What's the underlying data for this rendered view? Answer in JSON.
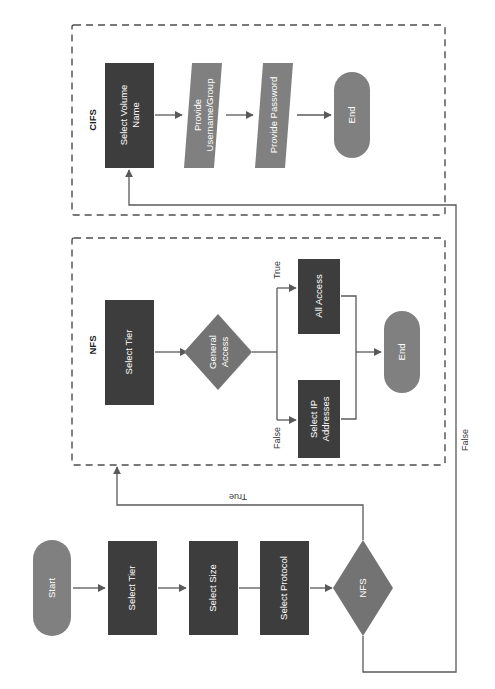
{
  "diagram": {
    "orientation": "rotated-90-counterclockwise",
    "colors": {
      "process_fill": "#3d3d3d",
      "terminal_fill": "#808080",
      "decision_fill": "#737373",
      "io_fill": "#808080",
      "edge_stroke": "#595959",
      "group_border": "#4d4d4d",
      "label_text": "#ffffff",
      "background": "#ffffff"
    },
    "groups": [
      {
        "id": "cifs",
        "label": "CIFS"
      },
      {
        "id": "nfs",
        "label": "NFS"
      }
    ],
    "nodes": [
      {
        "id": "start",
        "label": "Start",
        "shape": "terminal"
      },
      {
        "id": "tier_main",
        "label": "Select Tier",
        "shape": "process"
      },
      {
        "id": "size",
        "label": "Select Size",
        "shape": "process"
      },
      {
        "id": "protocol",
        "label": "Select Protocol",
        "shape": "process"
      },
      {
        "id": "nfs_dec",
        "label": "NFS",
        "shape": "decision"
      },
      {
        "id": "nfs_tier",
        "label": "Select Tier",
        "shape": "process"
      },
      {
        "id": "gen_access",
        "label": "General Access",
        "shape": "decision"
      },
      {
        "id": "all_access",
        "label": "All Access",
        "shape": "process"
      },
      {
        "id": "select_ip",
        "label": "Select IP Addresses",
        "shape": "process"
      },
      {
        "id": "nfs_end",
        "label": "End",
        "shape": "terminal"
      },
      {
        "id": "vol_name",
        "label": "Select Volume Name",
        "shape": "process"
      },
      {
        "id": "username",
        "label": "Provide Username/Group",
        "shape": "io"
      },
      {
        "id": "password",
        "label": "Provide Password",
        "shape": "io"
      },
      {
        "id": "cifs_end",
        "label": "End",
        "shape": "terminal"
      }
    ],
    "edge_labels": {
      "nfs_true": "True",
      "nfs_false": "False",
      "general_true": "True",
      "general_false": "False"
    }
  }
}
